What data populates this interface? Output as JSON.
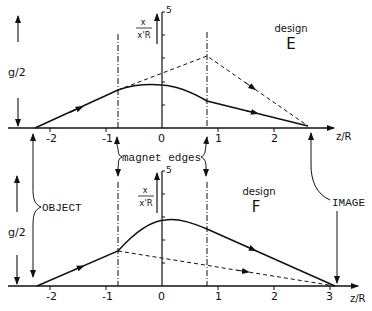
{
  "diagram": {
    "colors": {
      "ink": "#111111",
      "background": "#ffffff"
    },
    "x_axis_label": "z/R",
    "y_axis_label_num": "x",
    "y_axis_label_den": "x'R",
    "y_axis_max": "5",
    "panels": [
      {
        "design_word": "design",
        "design_letter": "E",
        "x_ticks": [
          "-2",
          "-1",
          "0",
          "1",
          "2"
        ],
        "gap_label": "g/2"
      },
      {
        "design_word": "design",
        "design_letter": "F",
        "x_ticks": [
          "-2",
          "-1",
          "0",
          "1",
          "2",
          "3"
        ],
        "gap_label": "g/2"
      }
    ],
    "annotations": {
      "magnet_edges": "magnet edges",
      "object": "OBJECT",
      "image": "IMAGE"
    }
  }
}
